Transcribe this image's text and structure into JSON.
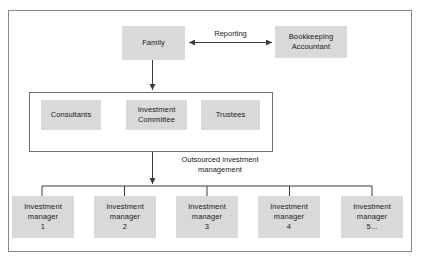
{
  "diagram": {
    "colors": {
      "node_fill": "#d9d9d9",
      "frame_border": "#8a8a8a",
      "group_border": "#6e6e6e",
      "connector": "#3c3c3c",
      "text": "#1a1a1a",
      "background": "#ffffff"
    },
    "top_row": {
      "family": {
        "label": "Family"
      },
      "bookkeeping": {
        "line1": "Bookkeeping",
        "line2": "Accountant"
      },
      "reporting_label": "Reporting"
    },
    "advisors_group": {
      "boxes": [
        {
          "line1": "Consultants",
          "line2": ""
        },
        {
          "line1": "Investment",
          "line2": "Committee"
        },
        {
          "line1": "Trustees",
          "line2": ""
        }
      ]
    },
    "outsourced_label": {
      "line1": "Outsourced investment",
      "line2": "management"
    },
    "managers": [
      {
        "line1": "Investment",
        "line2": "manager",
        "line3": "1"
      },
      {
        "line1": "Investment",
        "line2": "manager",
        "line3": "2"
      },
      {
        "line1": "Investment",
        "line2": "manager",
        "line3": "3"
      },
      {
        "line1": "Investment",
        "line2": "manager",
        "line3": "4"
      },
      {
        "line1": "Investment",
        "line2": "manager",
        "line3": "5..."
      }
    ]
  }
}
